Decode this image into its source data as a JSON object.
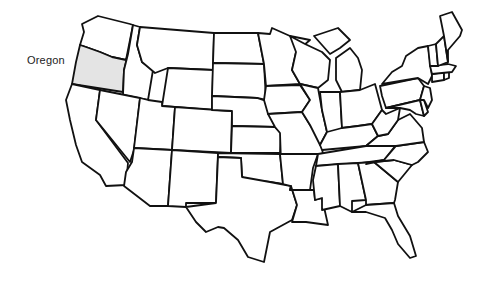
{
  "map": {
    "title": "United States",
    "highlight_color": "#e4e4e4",
    "stroke_color": "#111111",
    "highlighted_state": "Oregon",
    "label": {
      "text": "Oregon"
    },
    "states": [
      "Washington",
      "Oregon",
      "California",
      "Idaho",
      "Nevada",
      "Montana",
      "Wyoming",
      "Utah",
      "Arizona",
      "Colorado",
      "New Mexico",
      "North Dakota",
      "South Dakota",
      "Nebraska",
      "Kansas",
      "Oklahoma",
      "Texas",
      "Minnesota",
      "Iowa",
      "Missouri",
      "Arkansas",
      "Louisiana",
      "Wisconsin",
      "Illinois",
      "Michigan",
      "Indiana",
      "Ohio",
      "Kentucky",
      "Tennessee",
      "Mississippi",
      "Alabama",
      "Georgia",
      "Florida",
      "South Carolina",
      "North Carolina",
      "Virginia",
      "West Virginia",
      "Pennsylvania",
      "New York",
      "Maryland",
      "Delaware",
      "New Jersey",
      "Connecticut",
      "Rhode Island",
      "Massachusetts",
      "Vermont",
      "New Hampshire",
      "Maine"
    ]
  }
}
